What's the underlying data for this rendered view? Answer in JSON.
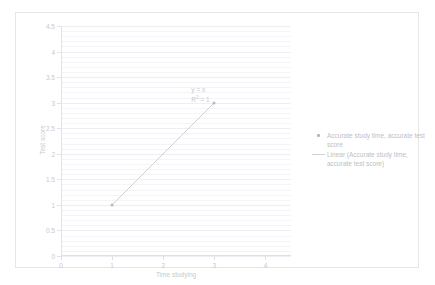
{
  "chart_data": {
    "type": "scatter",
    "title": "",
    "xlabel": "Time studying",
    "ylabel": "Test score",
    "xlim": [
      0,
      4.5
    ],
    "ylim": [
      0,
      4.5
    ],
    "xticks": [
      "0",
      "1",
      "2",
      "3",
      "4"
    ],
    "xtick_values": [
      0,
      1,
      2,
      3,
      4
    ],
    "yticks": [
      "0",
      "0.5",
      "1",
      "1.5",
      "2",
      "2.5",
      "3",
      "3.5",
      "4",
      "4.5"
    ],
    "ytick_values": [
      0,
      0.5,
      1,
      1.5,
      2,
      2.5,
      3,
      3.5,
      4,
      4.5
    ],
    "grid": "horizontal",
    "legend_position": "right",
    "series": [
      {
        "name": "Accurate study time, accurate test score",
        "type": "scatter",
        "marker": "dot",
        "color": "#b9b9b9",
        "points": [
          {
            "x": 1,
            "y": 1
          },
          {
            "x": 3,
            "y": 3
          }
        ]
      },
      {
        "name": "Linear (Accurate study time, accurate test score)",
        "type": "trendline",
        "marker": "line",
        "color": "#d2d2d2",
        "from": {
          "x": 1,
          "y": 1
        },
        "to": {
          "x": 3,
          "y": 3
        }
      }
    ],
    "annotations": [
      {
        "name": "trendline-equation",
        "line1": "y = x",
        "line2_prefix": "R",
        "line2_sup": "2",
        "line2_suffix": " = 1",
        "at": {
          "x": 2.55,
          "y": 3.25
        }
      }
    ]
  },
  "legend": {
    "entries": [
      {
        "label": "Accurate study time, accurate test score",
        "marker": "dot-marker-icon"
      },
      {
        "label": "Linear (Accurate study time, accurate test score)",
        "marker": "line-marker-icon"
      }
    ]
  },
  "axes": {
    "x_title": "Time studying",
    "y_title": "Test score"
  }
}
